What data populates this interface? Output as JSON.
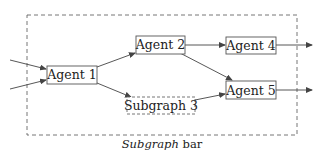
{
  "diagram": {
    "outer_subgraph": {
      "label_italic": "Subgraph",
      "label_rest": " bar"
    },
    "nodes": [
      {
        "id": "agent1",
        "label": "Agent 1",
        "style": "solid"
      },
      {
        "id": "agent2",
        "label": "Agent 2",
        "style": "solid"
      },
      {
        "id": "agent4",
        "label": "Agent 4",
        "style": "solid"
      },
      {
        "id": "agent5",
        "label": "Agent 5",
        "style": "solid"
      },
      {
        "id": "subgraph3",
        "label": "Subgraph 3",
        "style": "dashed"
      }
    ],
    "edges": [
      {
        "from": "external-input-1",
        "to": "agent1"
      },
      {
        "from": "external-input-2",
        "to": "agent1"
      },
      {
        "from": "agent1",
        "to": "agent2"
      },
      {
        "from": "agent1",
        "to": "subgraph3"
      },
      {
        "from": "agent2",
        "to": "agent4"
      },
      {
        "from": "agent2",
        "to": "agent5"
      },
      {
        "from": "subgraph3",
        "to": "agent5"
      },
      {
        "from": "agent4",
        "to": "external-output-1"
      },
      {
        "from": "agent5",
        "to": "external-output-2"
      }
    ],
    "colors": {
      "stroke": "#555555",
      "text": "#222222",
      "background": "#ffffff"
    }
  }
}
